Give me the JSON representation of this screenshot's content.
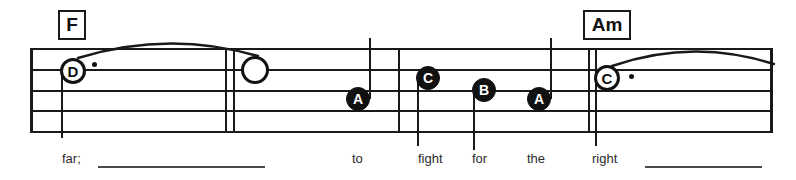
{
  "sheet": {
    "width": 796,
    "height": 180,
    "background": "#ffffff",
    "ink_color": "#1a1a1a",
    "lyric_color": "#2b2b2b"
  },
  "chords": [
    {
      "label": "F",
      "x": 58,
      "y": 10,
      "w": 28,
      "h": 30
    },
    {
      "label": "Am",
      "x": 583,
      "y": 10,
      "w": 48,
      "h": 30
    }
  ],
  "staff": {
    "left": 30,
    "right": 772,
    "line_count": 5,
    "line_y": [
      48,
      69,
      90,
      110,
      131
    ],
    "lines": [
      {
        "y": 48,
        "x1": 30,
        "x2": 772
      },
      {
        "y": 69,
        "x1": 30,
        "x2": 772
      },
      {
        "y": 90,
        "x1": 30,
        "x2": 772
      },
      {
        "y": 110,
        "x1": 30,
        "x2": 772
      },
      {
        "y": 131,
        "x1": 30,
        "x2": 772
      }
    ],
    "barlines": [
      {
        "name": "staff-start-barline",
        "x": 30,
        "y1": 48,
        "y2": 133,
        "thick": true
      },
      {
        "name": "measure-barline-1a",
        "x": 225,
        "y1": 48,
        "y2": 133,
        "thick": false
      },
      {
        "name": "measure-barline-1b",
        "x": 233,
        "y1": 48,
        "y2": 133,
        "thick": false
      },
      {
        "name": "measure-barline-2",
        "x": 398,
        "y1": 48,
        "y2": 133,
        "thick": false
      },
      {
        "name": "measure-barline-3a",
        "x": 588,
        "y1": 48,
        "y2": 133,
        "thick": false
      },
      {
        "name": "measure-barline-3b",
        "x": 595,
        "y1": 48,
        "y2": 133,
        "thick": false
      },
      {
        "name": "staff-end-barline",
        "x": 770,
        "y1": 48,
        "y2": 133,
        "thick": true
      }
    ]
  },
  "notes": [
    {
      "name": "note-d-half-dotted",
      "letter": "D",
      "style": "hollow",
      "cx": 73,
      "cy": 71,
      "r": 13,
      "font_size": 15,
      "dot": {
        "x": 92,
        "y": 62
      },
      "stem": {
        "x": 61,
        "y1": 71,
        "y2": 138,
        "dir": "down"
      }
    },
    {
      "name": "note-blank-half",
      "letter": "",
      "style": "blank",
      "cx": 255,
      "cy": 70,
      "r": 14,
      "font_size": 15,
      "dot": null,
      "stem": null
    },
    {
      "name": "note-a-quarter-1",
      "letter": "A",
      "style": "filled",
      "cx": 358,
      "cy": 99,
      "r": 12,
      "font_size": 14,
      "dot": null,
      "stem": {
        "x": 369,
        "y1": 38,
        "y2": 99,
        "dir": "up"
      }
    },
    {
      "name": "note-c-quarter",
      "letter": "C",
      "style": "filled",
      "cx": 428,
      "cy": 78,
      "r": 12,
      "font_size": 14,
      "dot": null,
      "stem": {
        "x": 417,
        "y1": 78,
        "y2": 146,
        "dir": "down"
      }
    },
    {
      "name": "note-b-quarter",
      "letter": "B",
      "style": "filled",
      "cx": 484,
      "cy": 90,
      "r": 12,
      "font_size": 14,
      "dot": null,
      "stem": {
        "x": 473,
        "y1": 90,
        "y2": 150,
        "dir": "down"
      }
    },
    {
      "name": "note-a-quarter-2",
      "letter": "A",
      "style": "filled",
      "cx": 539,
      "cy": 99,
      "r": 12,
      "font_size": 14,
      "dot": null,
      "stem": {
        "x": 550,
        "y1": 38,
        "y2": 99,
        "dir": "up"
      }
    },
    {
      "name": "note-c-half-dotted",
      "letter": "C",
      "style": "hollow",
      "cx": 607,
      "cy": 78,
      "r": 13,
      "font_size": 15,
      "dot": {
        "x": 629,
        "y": 74
      },
      "stem": {
        "x": 595,
        "y1": 78,
        "y2": 146,
        "dir": "down"
      }
    }
  ],
  "slurs": [
    {
      "name": "slur-f-phrase",
      "x": 78,
      "y": 40,
      "w": 180,
      "h": 18,
      "peak": 14
    },
    {
      "name": "slur-am-phrase",
      "x": 612,
      "y": 48,
      "w": 162,
      "h": 18,
      "peak": 14
    }
  ],
  "lyrics": {
    "baseline_y": 152,
    "words": [
      {
        "text": "far;",
        "x": 62,
        "y": 152
      },
      {
        "text": "to",
        "x": 352,
        "y": 152
      },
      {
        "text": "fight",
        "x": 418,
        "y": 152
      },
      {
        "text": "for",
        "x": 472,
        "y": 152
      },
      {
        "text": "the",
        "x": 527,
        "y": 152
      },
      {
        "text": "right",
        "x": 592,
        "y": 152
      }
    ],
    "extensions": [
      {
        "name": "lyric-extension-far",
        "x": 98,
        "y": 166,
        "w": 167
      },
      {
        "name": "lyric-extension-right",
        "x": 645,
        "y": 166,
        "w": 117
      }
    ]
  }
}
